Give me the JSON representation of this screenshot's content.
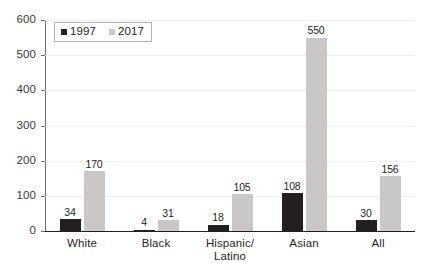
{
  "chart_data": {
    "type": "bar",
    "title": "",
    "subtitle": "",
    "xlabel": "",
    "ylabel": "",
    "ylim": [
      0,
      600
    ],
    "y_ticks": [
      0,
      100,
      200,
      300,
      400,
      500,
      600
    ],
    "grid": true,
    "legend_position": "top-left",
    "categories": [
      "White",
      "Black",
      "Hispanic/Latino",
      "Asian",
      "All"
    ],
    "category_lines": [
      [
        "White"
      ],
      [
        "Black"
      ],
      [
        "Hispanic/",
        "Latino"
      ],
      [
        "Asian"
      ],
      [
        "All"
      ]
    ],
    "series": [
      {
        "name": "1997",
        "color": "#231f20",
        "values": [
          34,
          4,
          18,
          108,
          30
        ]
      },
      {
        "name": "2017",
        "color": "#c9c8c6",
        "values": [
          170,
          31,
          105,
          550,
          156
        ]
      }
    ],
    "data_labels": {
      "1997": [
        "34",
        "4",
        "18",
        "108",
        "30"
      ],
      "2017": [
        "170",
        "31",
        "105",
        "550",
        "156"
      ]
    }
  },
  "legend": {
    "entries": [
      {
        "label": "1997",
        "swatch": "legend-swatch-1997"
      },
      {
        "label": "2017",
        "swatch": "legend-swatch-2017"
      }
    ]
  },
  "axis": {
    "y_tick_labels": [
      "600",
      "500",
      "400",
      "300",
      "200",
      "100",
      "0"
    ]
  },
  "colors": {
    "series_1997": "#231f20",
    "series_2017": "#c9c8c6",
    "gridline": "#f0efee",
    "axis": "#6e6c6b",
    "baseline": "#231f20",
    "text": "#231f20",
    "background": "#ffffff"
  }
}
